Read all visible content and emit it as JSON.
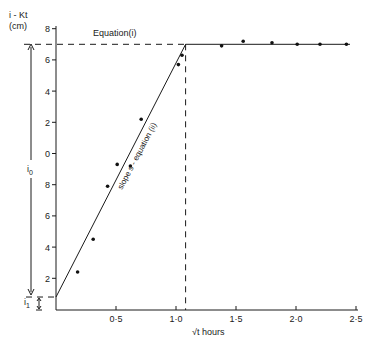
{
  "chart_data": {
    "type": "line",
    "title": "",
    "ylabel": "i - Kt (cm)",
    "xlabel": "√t  hours",
    "xlim": [
      0,
      2.55
    ],
    "ylim": [
      0,
      18
    ],
    "grid": false,
    "x_ticks": [
      {
        "value": 0.5,
        "label": "0·5"
      },
      {
        "value": 1.0,
        "label": "1·0"
      },
      {
        "value": 1.5,
        "label": "1·5"
      },
      {
        "value": 2.0,
        "label": "2·0"
      },
      {
        "value": 2.5,
        "label": "2·5"
      }
    ],
    "y_ticks": [
      {
        "value": 2,
        "label": "2"
      },
      {
        "value": 4,
        "label": "4"
      },
      {
        "value": 6,
        "label": "6"
      },
      {
        "value": 8,
        "label": "8"
      },
      {
        "value": 10,
        "label": "0"
      },
      {
        "value": 12,
        "label": "2"
      },
      {
        "value": 14,
        "label": "4"
      },
      {
        "value": 16,
        "label": "6"
      },
      {
        "value": 18,
        "label": "8"
      }
    ],
    "series": [
      {
        "name": "observed",
        "kind": "scatter",
        "x": [
          0.18,
          0.31,
          0.43,
          0.51,
          0.62,
          0.71,
          1.02,
          1.05,
          1.38,
          1.56,
          1.8,
          2.01,
          2.2,
          2.42
        ],
        "y": [
          2.4,
          4.5,
          7.9,
          9.3,
          9.2,
          12.2,
          15.7,
          16.3,
          16.9,
          17.2,
          17.1,
          17.0,
          17.0,
          17.0
        ]
      },
      {
        "name": "slope s - equation (ii)",
        "kind": "line",
        "x": [
          0,
          1.08
        ],
        "y": [
          0.8,
          17.0
        ]
      },
      {
        "name": "Equation(i)",
        "kind": "line",
        "x": [
          1.08,
          2.45
        ],
        "y": [
          17.0,
          17.0
        ]
      }
    ],
    "annotations": [
      {
        "text": "Equation(i)",
        "type": "label"
      },
      {
        "text": "slope s- equation (ii)",
        "type": "rotated-label"
      },
      {
        "text": "i₀",
        "type": "dimension-arrow",
        "from": 0.8,
        "to": 17.0
      },
      {
        "text": "i₁",
        "type": "dimension-arrow",
        "from": 0,
        "to": 0.8
      },
      {
        "type": "dashed-vertical",
        "x": 1.08
      },
      {
        "type": "dashed-horizontal",
        "y": 17.0
      },
      {
        "type": "dashed-horizontal",
        "y": 0.8
      }
    ]
  },
  "labels": {
    "ylabel_line1": "i - Kt",
    "ylabel_line2": "(cm)",
    "xlabel": "√t  hours",
    "equation_i": "Equation(i)",
    "equation_ii": "slope  s - equation  (ii)",
    "i0": "i",
    "i0_sub": "0",
    "i1": "i",
    "i1_sub": "1"
  }
}
